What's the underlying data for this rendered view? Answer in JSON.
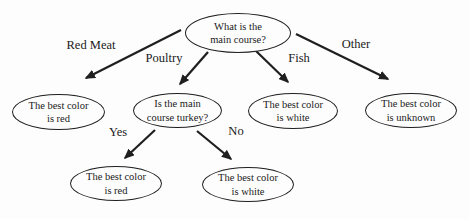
{
  "diagram": {
    "type": "decision-tree",
    "background_color": "#fdfdfd",
    "line_color": "#1f1f1f",
    "text_color": "#1a1a1a",
    "nodes": {
      "root": "What is the\nmain course?",
      "best_red": "The best color\nis red",
      "turkey_question": "Is the main\ncourse turkey?",
      "best_white": "The best color\nis white",
      "best_unknown": "The best color\nis unknown",
      "best_red_2": "The best color\nis red",
      "best_white_2": "The best color\nis white"
    },
    "edge_labels": {
      "red_meat": "Red Meat",
      "poultry": "Poultry",
      "fish": "Fish",
      "other": "Other",
      "yes": "Yes",
      "no": "No"
    }
  }
}
